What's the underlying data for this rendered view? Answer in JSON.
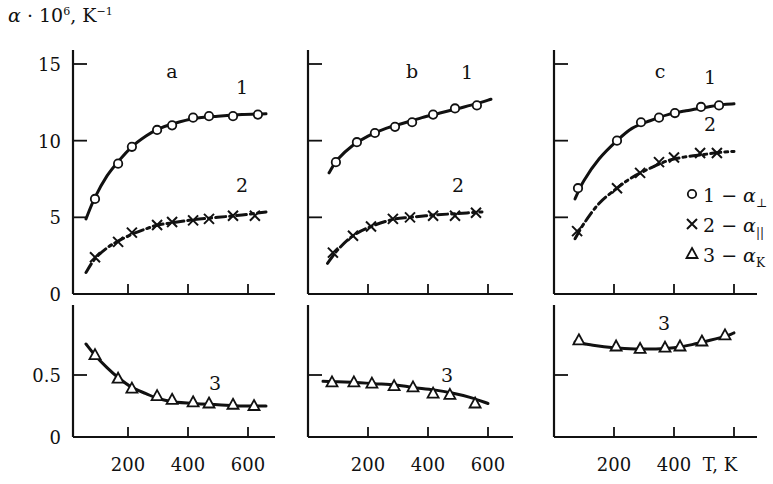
{
  "chart_data": {
    "type": "scatter",
    "title": "",
    "ylabel": "α · 10^6, K^-1",
    "ylabel_parts": {
      "alpha": "α",
      "dot": " · 10",
      "exp": "6",
      "unit": ",  K",
      "unit_exp": "−1"
    },
    "xlabel": "T, K",
    "panels": [
      {
        "id": "a",
        "label": "a",
        "x_ticks": [
          200,
          400,
          600
        ],
        "x_tick_labels": [
          "200",
          "400",
          "600"
        ],
        "upper": {
          "ylim": [
            0,
            15
          ],
          "y_ticks": [
            0,
            5,
            10,
            15
          ],
          "y_tick_labels": [
            "0",
            "5",
            "10",
            "15"
          ],
          "series": [
            {
              "name": "1",
              "marker": "circle",
              "curve_label": "1",
              "x": [
                90,
                167,
                213,
                297,
                347,
                417,
                470,
                550,
                633
              ],
              "y": [
                6.2,
                8.5,
                9.6,
                10.7,
                11.0,
                11.5,
                11.6,
                11.6,
                11.7
              ],
              "fit": {
                "x": [
                  60,
                  90,
                  130,
                  170,
                  213,
                  260,
                  300,
                  350,
                  420,
                  500,
                  580,
                  660
                ],
                "y": [
                  4.9,
                  6.3,
                  7.7,
                  8.7,
                  9.6,
                  10.3,
                  10.75,
                  11.1,
                  11.45,
                  11.6,
                  11.7,
                  11.75
                ]
              }
            },
            {
              "name": "2",
              "marker": "cross",
              "curve_label": "2",
              "dashed": true,
              "x": [
                90,
                167,
                213,
                297,
                347,
                417,
                470,
                550,
                623
              ],
              "y": [
                2.4,
                3.4,
                4.0,
                4.5,
                4.7,
                4.8,
                4.9,
                5.1,
                5.1
              ],
              "fit": {
                "x": [
                  60,
                  90,
                  130,
                  167,
                  213,
                  260,
                  300,
                  350,
                  420,
                  500,
                  580,
                  660
                ],
                "y": [
                  1.4,
                  2.3,
                  3.0,
                  3.45,
                  3.9,
                  4.25,
                  4.5,
                  4.65,
                  4.85,
                  5.0,
                  5.15,
                  5.35
                ]
              }
            }
          ]
        },
        "lower": {
          "ylim": [
            0,
            0.8
          ],
          "y_ticks": [
            0,
            0.5
          ],
          "y_tick_labels": [
            "0",
            "0.5"
          ],
          "series": [
            {
              "name": "3",
              "marker": "triangle",
              "curve_label": "3",
              "x": [
                90,
                167,
                213,
                297,
                347,
                417,
                470,
                550,
                620
              ],
              "y": [
                0.66,
                0.47,
                0.39,
                0.33,
                0.3,
                0.28,
                0.27,
                0.26,
                0.25
              ],
              "fit": {
                "x": [
                  60,
                  90,
                  130,
                  167,
                  213,
                  260,
                  300,
                  350,
                  420,
                  500,
                  580,
                  660
                ],
                "y": [
                  0.75,
                  0.66,
                  0.56,
                  0.48,
                  0.4,
                  0.35,
                  0.31,
                  0.285,
                  0.27,
                  0.26,
                  0.25,
                  0.25
                ]
              }
            }
          ]
        }
      },
      {
        "id": "b",
        "label": "b",
        "x_ticks": [
          200,
          400,
          600
        ],
        "x_tick_labels": [
          "200",
          "400",
          "600"
        ],
        "upper": {
          "ylim": [
            0,
            15
          ],
          "y_ticks": [
            5,
            10,
            15
          ],
          "y_tick_labels": [],
          "series": [
            {
              "name": "1",
              "marker": "circle",
              "curve_label": "1",
              "x": [
                93,
                163,
                223,
                290,
                347,
                417,
                490,
                563
              ],
              "y": [
                8.6,
                9.9,
                10.5,
                10.9,
                11.2,
                11.7,
                12.1,
                12.3
              ],
              "fit": {
                "x": [
                  70,
                  100,
                  150,
                  200,
                  260,
                  320,
                  380,
                  440,
                  500,
                  560,
                  610
                ],
                "y": [
                  7.9,
                  8.8,
                  9.7,
                  10.3,
                  10.8,
                  11.15,
                  11.5,
                  11.8,
                  12.1,
                  12.4,
                  12.7
                ]
              }
            },
            {
              "name": "2",
              "marker": "cross",
              "curve_label": "2",
              "dashed": true,
              "x": [
                83,
                150,
                210,
                283,
                340,
                417,
                490,
                560
              ],
              "y": [
                2.7,
                3.8,
                4.4,
                4.9,
                5.0,
                5.1,
                5.1,
                5.3
              ],
              "fit": {
                "x": [
                  65,
                  100,
                  150,
                  210,
                  280,
                  340,
                  420,
                  500,
                  580
                ],
                "y": [
                  2.0,
                  2.9,
                  3.8,
                  4.4,
                  4.85,
                  5.0,
                  5.15,
                  5.25,
                  5.35
                ]
              }
            }
          ]
        },
        "lower": {
          "ylim": [
            0,
            0.8
          ],
          "y_ticks": [
            0.5
          ],
          "y_tick_labels": [],
          "series": [
            {
              "name": "3",
              "marker": "triangle",
              "curve_label": "3",
              "x": [
                80,
                153,
                213,
                287,
                350,
                417,
                473,
                557
              ],
              "y": [
                0.44,
                0.44,
                0.43,
                0.41,
                0.4,
                0.35,
                0.34,
                0.27
              ],
              "fit": {
                "x": [
                  50,
                  100,
                  160,
                  220,
                  290,
                  350,
                  420,
                  480,
                  540,
                  600
                ],
                "y": [
                  0.45,
                  0.445,
                  0.44,
                  0.43,
                  0.42,
                  0.4,
                  0.38,
                  0.355,
                  0.32,
                  0.27
                ]
              }
            }
          ]
        }
      },
      {
        "id": "c",
        "label": "c",
        "x_ticks": [
          200,
          400,
          600
        ],
        "x_tick_labels": [
          "200",
          "400",
          "T, K"
        ],
        "upper": {
          "ylim": [
            0,
            15
          ],
          "y_ticks": [
            5,
            10,
            15
          ],
          "y_tick_labels": [],
          "series": [
            {
              "name": "1",
              "marker": "circle",
              "curve_label": "1",
              "x": [
                80,
                210,
                290,
                350,
                403,
                490,
                550
              ],
              "y": [
                6.9,
                10.0,
                11.2,
                11.5,
                11.8,
                12.2,
                12.3
              ],
              "fit": {
                "x": [
                  70,
                  100,
                  150,
                  210,
                  260,
                  320,
                  380,
                  440,
                  500,
                  560,
                  600
                ],
                "y": [
                  6.2,
                  7.4,
                  8.8,
                  10.0,
                  10.8,
                  11.3,
                  11.7,
                  11.95,
                  12.15,
                  12.35,
                  12.4
                ]
              }
            },
            {
              "name": "2",
              "marker": "cross",
              "curve_label": "2",
              "dashed": true,
              "x": [
                77,
                210,
                287,
                350,
                400,
                487,
                543
              ],
              "y": [
                4.1,
                6.9,
                7.9,
                8.6,
                8.9,
                9.2,
                9.2
              ],
              "fit": {
                "x": [
                  70,
                  100,
                  150,
                  210,
                  260,
                  320,
                  380,
                  440,
                  500,
                  560,
                  600
                ],
                "y": [
                  3.6,
                  4.6,
                  5.9,
                  6.9,
                  7.6,
                  8.2,
                  8.7,
                  8.95,
                  9.1,
                  9.25,
                  9.3
                ]
              }
            }
          ]
        },
        "lower": {
          "ylim": [
            0,
            0.8
          ],
          "y_ticks": [
            0.5
          ],
          "y_tick_labels": [],
          "series": [
            {
              "name": "3",
              "marker": "triangle",
              "curve_label": "3",
              "x": [
                83,
                207,
                287,
                370,
                420,
                493,
                570
              ],
              "y": [
                0.78,
                0.73,
                0.71,
                0.72,
                0.73,
                0.77,
                0.82
              ],
              "fit": {
                "x": [
                  70,
                  130,
                  200,
                  270,
                  340,
                  400,
                  460,
                  520,
                  580,
                  600
                ],
                "y": [
                  0.765,
                  0.74,
                  0.72,
                  0.71,
                  0.71,
                  0.72,
                  0.745,
                  0.78,
                  0.82,
                  0.84
                ]
              }
            }
          ]
        }
      }
    ],
    "legend": {
      "position": "right of panel c",
      "entries": [
        {
          "marker": "circle",
          "text": "1 − α",
          "subscript": "⊥"
        },
        {
          "marker": "cross",
          "text": "2 − α",
          "subscript": "||"
        },
        {
          "marker": "triangle",
          "text": "3 − α",
          "subscript": "K"
        }
      ]
    },
    "grid": false
  }
}
